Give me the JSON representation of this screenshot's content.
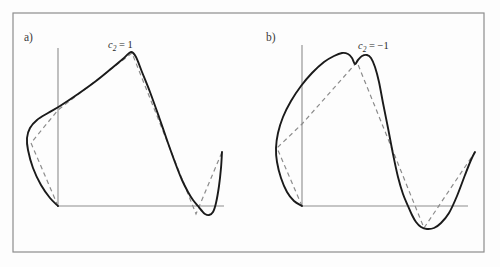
{
  "figure": {
    "width": 500,
    "height": 267,
    "background_color": "#fdfdfd",
    "frame": {
      "name": "outer-frame",
      "x": 13,
      "y": 13,
      "width": 471,
      "height": 239,
      "stroke": "#8d8d8d",
      "stroke_width": 1.2
    },
    "colors": {
      "curve": "#1a1a1a",
      "approximation": "#8c8c8c",
      "axis": "#8d8d8d",
      "text": "#2b2b2b"
    },
    "panels": [
      {
        "id": "a",
        "letter": "a)",
        "letter_pos": {
          "x": 24,
          "y": 41
        },
        "label": {
          "prefix": "c",
          "subscript": "2",
          "operator": " = ",
          "value": "1"
        },
        "label_pos": {
          "x": 108,
          "y": 48
        },
        "axes": {
          "y_axis": {
            "x": 58,
            "y_top": 48,
            "y_bottom": 207
          },
          "x_axis": {
            "y": 206,
            "x_left": 57,
            "x_right": 224
          }
        },
        "curve_points": [
          [
            58,
            206
          ],
          [
            50,
            198
          ],
          [
            41,
            185
          ],
          [
            33,
            168
          ],
          [
            28,
            150
          ],
          [
            27,
            138
          ],
          [
            30,
            128
          ],
          [
            37,
            120
          ],
          [
            48,
            113
          ],
          [
            60,
            106
          ],
          [
            78,
            94
          ],
          [
            96,
            81
          ],
          [
            112,
            68
          ],
          [
            124,
            58
          ],
          [
            131,
            52
          ],
          [
            136,
            57
          ],
          [
            142,
            72
          ],
          [
            150,
            92
          ],
          [
            159,
            117
          ],
          [
            168,
            143
          ],
          [
            176,
            165
          ],
          [
            182,
            180
          ],
          [
            188,
            192
          ],
          [
            193,
            200
          ],
          [
            198,
            206
          ],
          [
            202,
            211
          ],
          [
            205,
            214
          ],
          [
            209,
            215
          ],
          [
            213,
            212
          ],
          [
            216,
            203
          ],
          [
            219,
            186
          ],
          [
            221,
            168
          ],
          [
            222,
            152
          ]
        ],
        "approximation_points": [
          [
            58,
            206
          ],
          [
            31,
            143
          ],
          [
            58,
            110
          ],
          [
            132,
            53
          ],
          [
            196,
            214
          ],
          [
            222,
            152
          ]
        ]
      },
      {
        "id": "b",
        "letter": "b)",
        "letter_pos": {
          "x": 266,
          "y": 41
        },
        "label": {
          "prefix": "c",
          "subscript": "2",
          "operator": " = ",
          "value": "−1"
        },
        "label_pos": {
          "x": 358,
          "y": 49
        },
        "axes": {
          "y_axis": {
            "x": 302,
            "y_top": 45,
            "y_bottom": 207
          },
          "x_axis": {
            "y": 206,
            "x_left": 301,
            "x_right": 468
          }
        },
        "curve_points": [
          [
            302,
            206
          ],
          [
            294,
            201
          ],
          [
            287,
            192
          ],
          [
            281,
            178
          ],
          [
            277,
            162
          ],
          [
            276,
            148
          ],
          [
            278,
            133
          ],
          [
            283,
            117
          ],
          [
            291,
            101
          ],
          [
            301,
            86
          ],
          [
            312,
            73
          ],
          [
            324,
            62
          ],
          [
            334,
            56
          ],
          [
            342,
            53
          ],
          [
            348,
            54
          ],
          [
            352,
            58
          ],
          [
            355,
            64
          ],
          [
            358,
            60
          ],
          [
            362,
            56
          ],
          [
            367,
            55
          ],
          [
            371,
            58
          ],
          [
            375,
            67
          ],
          [
            379,
            82
          ],
          [
            383,
            103
          ],
          [
            388,
            128
          ],
          [
            393,
            154
          ],
          [
            398,
            177
          ],
          [
            403,
            194
          ],
          [
            408,
            206
          ],
          [
            412,
            215
          ],
          [
            416,
            222
          ],
          [
            421,
            227
          ],
          [
            427,
            229
          ],
          [
            434,
            228
          ],
          [
            441,
            223
          ],
          [
            449,
            213
          ],
          [
            457,
            196
          ],
          [
            465,
            175
          ],
          [
            471,
            160
          ],
          [
            475,
            152
          ]
        ],
        "approximation_points": [
          [
            302,
            206
          ],
          [
            277,
            148
          ],
          [
            302,
            124
          ],
          [
            357,
            62
          ],
          [
            424,
            228
          ],
          [
            475,
            152
          ]
        ]
      }
    ]
  }
}
